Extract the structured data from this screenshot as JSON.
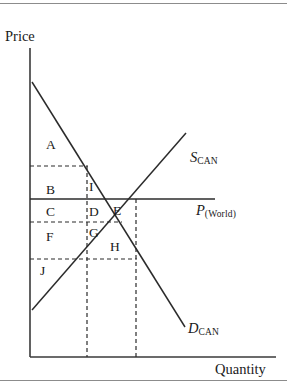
{
  "figure": {
    "type": "economics-supply-demand-diagram",
    "axes": {
      "y_label": "Price",
      "x_label": "Quantity"
    },
    "curves": [
      {
        "id": "supply",
        "symbol": "S",
        "subscript": "CAN",
        "label": "S_CAN"
      },
      {
        "id": "demand",
        "symbol": "D",
        "subscript": "CAN",
        "label": "D_CAN"
      }
    ],
    "lines": [
      {
        "id": "world-price",
        "symbol": "P",
        "subscript": "(World)",
        "label": "P_(World)"
      }
    ],
    "regions": [
      {
        "id": "region-a",
        "label": "A",
        "x": 46,
        "y": 138
      },
      {
        "id": "region-b",
        "label": "B",
        "x": 46,
        "y": 183
      },
      {
        "id": "region-c",
        "label": "C",
        "x": 46,
        "y": 205
      },
      {
        "id": "region-d",
        "label": "D",
        "x": 89,
        "y": 205
      },
      {
        "id": "region-e",
        "label": "E",
        "x": 113,
        "y": 204
      },
      {
        "id": "region-f",
        "label": "F",
        "x": 46,
        "y": 230
      },
      {
        "id": "region-g",
        "label": "G",
        "x": 89,
        "y": 226
      },
      {
        "id": "region-h",
        "label": "H",
        "x": 110,
        "y": 240
      },
      {
        "id": "region-i",
        "label": "I",
        "x": 89,
        "y": 180
      },
      {
        "id": "region-j",
        "label": "J",
        "x": 40,
        "y": 264
      }
    ]
  },
  "chart_data": {
    "type": "line",
    "title": "",
    "xlabel": "Quantity",
    "ylabel": "Price",
    "grid": false,
    "legend": "inline-curve-labels",
    "series": [
      {
        "name": "D_CAN",
        "role": "demand",
        "points": [
          [
            32,
            82
          ],
          [
            185,
            327
          ]
        ]
      },
      {
        "name": "S_CAN",
        "role": "supply",
        "points": [
          [
            32,
            310
          ],
          [
            186,
            133
          ]
        ]
      },
      {
        "name": "P_(World)",
        "role": "world-price",
        "points": [
          [
            30,
            199
          ],
          [
            215,
            199
          ]
        ]
      }
    ],
    "reference_lines": [
      {
        "orientation": "horizontal",
        "y": 166,
        "x_from": 30,
        "x_to": 88,
        "style": "dashed"
      },
      {
        "orientation": "horizontal",
        "y": 222,
        "x_from": 30,
        "x_to": 122,
        "style": "dashed"
      },
      {
        "orientation": "horizontal",
        "y": 259,
        "x_from": 30,
        "x_to": 137,
        "style": "dashed"
      },
      {
        "orientation": "vertical",
        "x": 87,
        "y_from": 166,
        "y_to": 357,
        "style": "dashed"
      },
      {
        "orientation": "vertical",
        "x": 136,
        "y_from": 199,
        "y_to": 357,
        "style": "dashed"
      }
    ],
    "axis_ranges": {
      "x_axis_y": 357,
      "y_axis_x": 30,
      "y_axis_top": 48
    }
  },
  "labels": {
    "price": "Price",
    "quantity": "Quantity",
    "supply_symbol": "S",
    "supply_subscript": "CAN",
    "demand_symbol": "D",
    "demand_subscript": "CAN",
    "world_price_symbol": "P",
    "world_price_subscript": "(World)",
    "region_a": "A",
    "region_b": "B",
    "region_c": "C",
    "region_d": "D",
    "region_e": "E",
    "region_f": "F",
    "region_g": "G",
    "region_h": "H",
    "region_i": "I",
    "region_j": "J"
  },
  "colors": {
    "ink": "#2b2b2b",
    "axis": "#3a3a3a",
    "frame": "#8c8c8c",
    "background": "#ffffff"
  }
}
